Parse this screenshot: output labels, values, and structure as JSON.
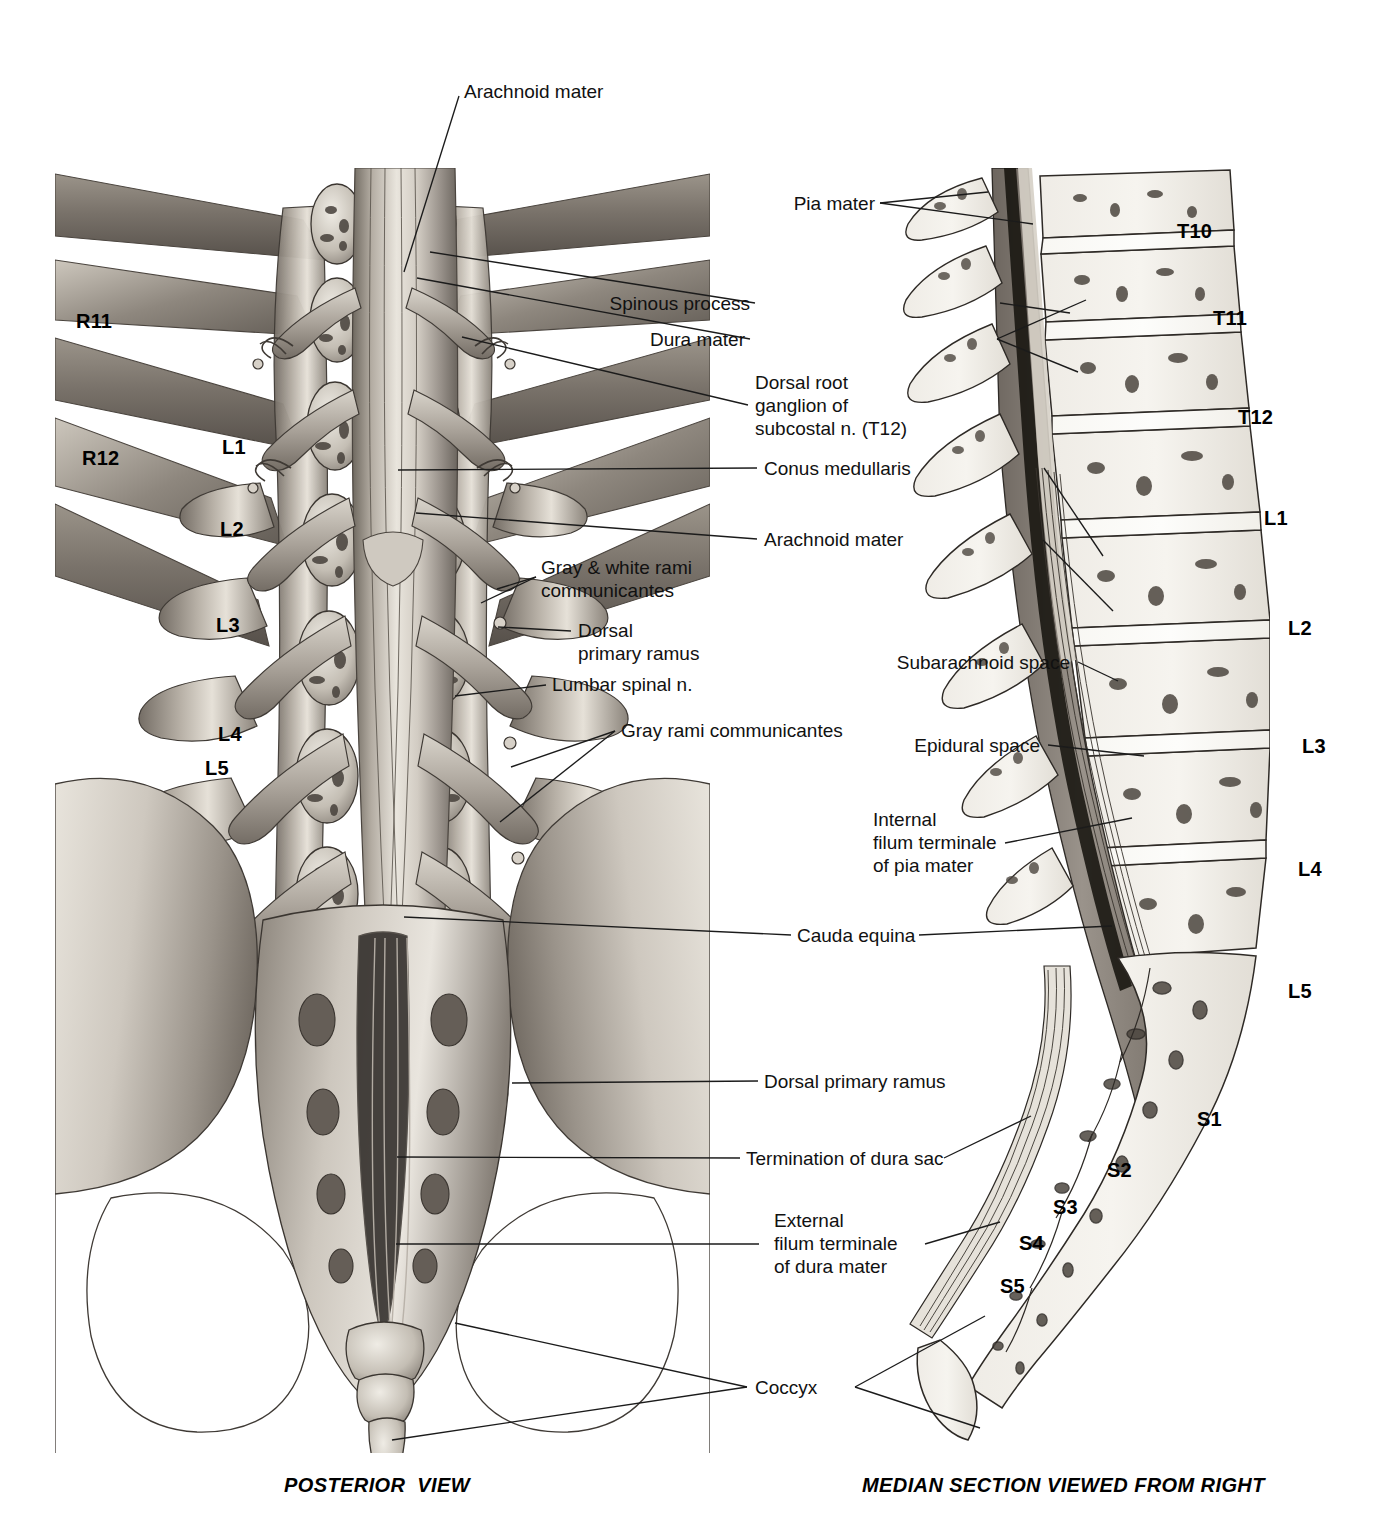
{
  "figure": {
    "left_panel_caption": "POSTERIOR  VIEW",
    "right_panel_caption": "MEDIAN SECTION VIEWED FROM RIGHT"
  },
  "left_panel": {
    "name": "posterior-view-of-lumbosacral-spine",
    "bone_labels": [
      {
        "id": "R11",
        "text": "R11"
      },
      {
        "id": "R12",
        "text": "R12"
      },
      {
        "id": "L1",
        "text": "L1"
      },
      {
        "id": "L2",
        "text": "L2"
      },
      {
        "id": "L3",
        "text": "L3"
      },
      {
        "id": "L4",
        "text": "L4"
      },
      {
        "id": "L5",
        "text": "L5"
      }
    ],
    "callouts": [
      {
        "id": "arachnoid-mater-top",
        "text": "Arachnoid mater"
      },
      {
        "id": "gray-white-rami-communicantes",
        "text": "Gray & white rami\ncommunicantes"
      },
      {
        "id": "dorsal-primary-ramus-upper",
        "text": "Dorsal\nprimary ramus"
      },
      {
        "id": "lumbar-spinal-n",
        "text": "Lumbar spinal n."
      },
      {
        "id": "gray-rami-communicantes",
        "text": "Gray rami communicantes"
      }
    ]
  },
  "center_callouts": [
    {
      "id": "spinous-process",
      "text": "Spinous process"
    },
    {
      "id": "dura-mater",
      "text": "Dura mater"
    },
    {
      "id": "dorsal-root-ganglion-subcostal",
      "text": "Dorsal root\nganglion of\nsubcostal n. (T12)"
    },
    {
      "id": "conus-medullaris",
      "text": "Conus medullaris"
    },
    {
      "id": "arachnoid-mater-mid",
      "text": "Arachnoid mater"
    },
    {
      "id": "subarachnoid-space",
      "text": "Subarachnoid space"
    },
    {
      "id": "epidural-space",
      "text": "Epidural space"
    },
    {
      "id": "internal-filum-terminale",
      "text": "Internal\nfilum terminale\nof pia mater"
    },
    {
      "id": "cauda-equina",
      "text": "Cauda equina"
    },
    {
      "id": "dorsal-primary-ramus-lower",
      "text": "Dorsal primary ramus"
    },
    {
      "id": "termination-of-dura-sac",
      "text": "Termination of dura sac"
    },
    {
      "id": "external-filum-terminale",
      "text": "External\nfilum terminale\nof dura mater"
    },
    {
      "id": "coccyx",
      "text": "Coccyx"
    },
    {
      "id": "pia-mater",
      "text": "Pia mater"
    }
  ],
  "right_panel": {
    "name": "median-section-viewed-from-right",
    "vertebra_labels": [
      {
        "id": "T10",
        "text": "T10"
      },
      {
        "id": "T11",
        "text": "T11"
      },
      {
        "id": "T12",
        "text": "T12"
      },
      {
        "id": "L1",
        "text": "L1"
      },
      {
        "id": "L2",
        "text": "L2"
      },
      {
        "id": "L3",
        "text": "L3"
      },
      {
        "id": "L4",
        "text": "L4"
      },
      {
        "id": "L5",
        "text": "L5"
      },
      {
        "id": "S1",
        "text": "S1"
      },
      {
        "id": "S2",
        "text": "S2"
      },
      {
        "id": "S3",
        "text": "S3"
      },
      {
        "id": "S4",
        "text": "S4"
      },
      {
        "id": "S5",
        "text": "S5"
      }
    ]
  },
  "colors": {
    "ink": "#1b1b1b",
    "bone_light": "#f2efe9",
    "bone_mid": "#c9c3ba",
    "bone_dark": "#8d867c",
    "shadow": "#5a544c",
    "cord": "#b9b3ab"
  }
}
